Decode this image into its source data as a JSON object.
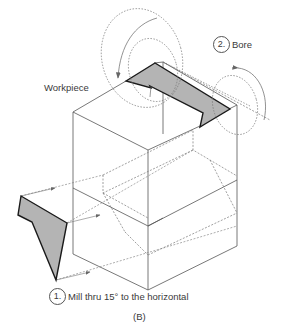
{
  "figure": {
    "caption": "(B)",
    "workpiece_label": "Workpiece",
    "operations": [
      {
        "number": "2.",
        "text": "Bore"
      },
      {
        "number": "1.",
        "text": "Mill thru 15° to the horizontal"
      }
    ]
  },
  "colors": {
    "line": "#555555",
    "hidden_line": "#777777",
    "shade": "#b4b4b4",
    "shade_edge": "#1a1a1a",
    "text": "#3a3a3a"
  }
}
